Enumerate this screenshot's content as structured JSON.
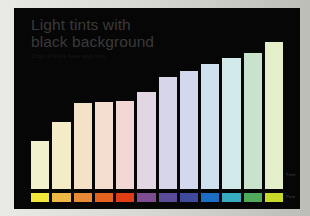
{
  "slide": {
    "background_color": "#050505",
    "title_line_1": "Light tints with",
    "title_line_2": "black background",
    "title_color": "#3a3a3a",
    "subtitle": "Chart of Pure hues and tints",
    "subtitle_color": "#1b1b1b",
    "edge_labels": {
      "tints": "Tints",
      "pure": "Pure"
    }
  },
  "chart_data": {
    "type": "bar",
    "title": "Light tints with black background",
    "subtitle": "Chart of Pure hues and tints",
    "xlabel": "",
    "ylabel": "",
    "ylim": [
      0,
      100
    ],
    "grid": false,
    "legend_position": "bottom",
    "categories": [
      "Yellow",
      "Amber",
      "Orange",
      "Dark Orange",
      "Red Orange",
      "Purple",
      "Violet",
      "Indigo",
      "Blue",
      "Cyan",
      "Green",
      "Yellow Green"
    ],
    "values": [
      35,
      49,
      63,
      64,
      65,
      71,
      82,
      87,
      92,
      96,
      100,
      108
    ],
    "series": [
      {
        "name": "Tints",
        "values": [
          35,
          49,
          63,
          64,
          65,
          71,
          82,
          87,
          92,
          96,
          100,
          108
        ],
        "colors": [
          "#f2f1cd",
          "#f4ecc6",
          "#f3e2c8",
          "#f3ded0",
          "#f0d6d4",
          "#e2d6e2",
          "#d6d5ea",
          "#d2d8ee",
          "#cfe0ef",
          "#d2eaea",
          "#c8e2cc",
          "#e4efc9"
        ]
      },
      {
        "name": "Pure",
        "colors": [
          "#f0e63c",
          "#edb944",
          "#e78a33",
          "#e4621f",
          "#e03c16",
          "#7e4d91",
          "#5a4c99",
          "#3f4a9c",
          "#1a6fc4",
          "#37acc0",
          "#4fa css",
          "#c9d92a"
        ]
      }
    ],
    "legend_entries": [
      "Tints",
      "Pure"
    ]
  },
  "swatch_colors": [
    "#f0e63c",
    "#edb944",
    "#e78a33",
    "#e4621f",
    "#e03c16",
    "#7e4d91",
    "#5a4c99",
    "#3f4a9c",
    "#1a6fc4",
    "#37acc0",
    "#4faa5c",
    "#c9d92a"
  ]
}
